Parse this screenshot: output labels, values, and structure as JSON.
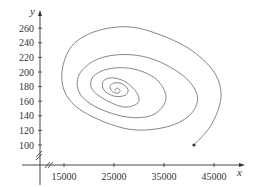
{
  "chart_data": {
    "type": "line",
    "title": "",
    "xlabel": "x",
    "ylabel": "y",
    "xlim": [
      10000,
      50000
    ],
    "ylim": [
      100,
      270
    ],
    "grid": false,
    "legend": null,
    "x_ticks": [
      15000,
      25000,
      35000,
      45000
    ],
    "x_tick_labels": [
      "15000",
      "25000",
      "35000",
      "45000"
    ],
    "y_ticks": [
      100,
      120,
      140,
      160,
      180,
      200,
      220,
      240,
      260
    ],
    "y_tick_labels": [
      "100",
      "120",
      "140",
      "160",
      "180",
      "200",
      "220",
      "240",
      "260"
    ],
    "axis_breaks": [
      "x",
      "y"
    ],
    "annotations": [
      "endpoint dot at start of trajectory"
    ],
    "series": [
      {
        "name": "trajectory",
        "description": "Inward spiral (phase trajectory) starting at the dot near (41000, 100), sweeping counterclockwise out to x≈46400 and y≈262, then spiralling in to an equilibrium near (25400, 174)",
        "start_point": {
          "x": 41000,
          "y": 100
        },
        "equilibrium": {
          "x": 25400,
          "y": 174
        },
        "x": [
          41000,
          44500,
          46400,
          45000,
          40000,
          33000,
          27200,
          21000,
          16500,
          14600,
          15500,
          19500,
          27600,
          35000,
          40000,
          41700,
          39000,
          33000,
          27000,
          21500,
          18000,
          18200,
          22000,
          28000,
          33000,
          35400,
          33500,
          29000,
          24500,
          21000,
          20500,
          23000,
          27000,
          29800,
          29500,
          27200,
          24500,
          22800,
          23000,
          25000,
          27200,
          27800,
          26600,
          25000,
          24200,
          24700,
          25800,
          26200,
          25600,
          25200,
          25400
        ],
        "y": [
          100,
          128,
          166,
          200,
          232,
          254,
          262,
          255,
          235,
          200,
          168,
          143,
          122,
          124,
          140,
          166,
          194,
          217,
          224,
          217,
          196,
          170,
          150,
          138,
          142,
          164,
          190,
          204,
          205,
          195,
          178,
          163,
          152,
          158,
          172,
          187,
          192,
          187,
          175,
          167,
          168,
          176,
          184,
          185,
          180,
          173,
          171,
          175,
          178,
          176,
          174
        ]
      }
    ]
  }
}
